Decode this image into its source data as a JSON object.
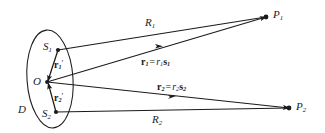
{
  "figure": {
    "background_color": "#ffffff",
    "stroke_color": "#1b1b1b",
    "text_color": "#1b1b1b",
    "width": 325,
    "height": 133
  },
  "labels": {
    "region": "D",
    "origin": "O",
    "source_point_1": {
      "base": "S",
      "sub": "1"
    },
    "source_point_2": {
      "base": "S",
      "sub": "2"
    },
    "field_point_1": {
      "base": "P",
      "sub": "1"
    },
    "field_point_2": {
      "base": "P",
      "sub": "2"
    },
    "distance_1": {
      "base": "R",
      "sub": "1"
    },
    "distance_2": {
      "base": "R",
      "sub": "2"
    },
    "local_vector_1": {
      "vec": "r",
      "sub": "1",
      "prime": "′"
    },
    "local_vector_2": {
      "vec": "r",
      "sub": "2",
      "prime": "′"
    },
    "position_vector_1": {
      "lhs_vec": "r",
      "lhs_sub": "1",
      "equals": "=",
      "rhs_scalar": "r",
      "rhs_scalar_sub": "1",
      "rhs_vec": "s",
      "rhs_vec_sub": "1"
    },
    "position_vector_2": {
      "lhs_vec": "r",
      "lhs_sub": "2",
      "equals": "=",
      "rhs_scalar": "r",
      "rhs_scalar_sub": "2",
      "rhs_vec": "s",
      "rhs_vec_sub": "2"
    }
  },
  "geometry": {
    "ellipse": {
      "cx": 50,
      "cy": 79,
      "rx": 23,
      "ry": 49,
      "rotation": -4
    },
    "points": {
      "S1": {
        "x": 58,
        "y": 50
      },
      "O": {
        "x": 47,
        "y": 82
      },
      "S2": {
        "x": 56,
        "y": 112
      },
      "P1": {
        "x": 266,
        "y": 17
      },
      "P2": {
        "x": 289,
        "y": 108
      }
    },
    "segments": [
      {
        "name": "R1",
        "from": "S1",
        "to": "P1",
        "arrow": false
      },
      {
        "name": "r1",
        "from": "O",
        "to": "P1",
        "arrow": true
      },
      {
        "name": "r2",
        "from": "O",
        "to": "P2",
        "arrow": true
      },
      {
        "name": "R2",
        "from": "S2",
        "to": "P2",
        "arrow": false
      },
      {
        "name": "r1prime",
        "from": "S1",
        "to": "O",
        "arrow": true
      },
      {
        "name": "r2prime",
        "from": "S2",
        "to": "O",
        "arrow": true
      }
    ]
  }
}
